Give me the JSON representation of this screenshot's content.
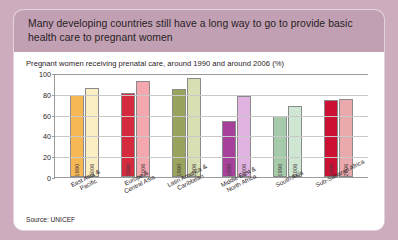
{
  "header": {
    "title": "Many developing countries still have a long way to go to provide basic health care to pregnant women"
  },
  "source": "Source: UNICEF",
  "chart_data": {
    "type": "bar",
    "title": "Pregnant women receiving prenatal care, around 1990 and around 2006 (%)",
    "xlabel": "",
    "ylabel": "",
    "ylim": [
      0,
      100
    ],
    "yticks": [
      100,
      80,
      60,
      40,
      20,
      0
    ],
    "grid": true,
    "legend": "in-bar",
    "categories": [
      "East Asia &\nPacific",
      "Europe &\nCentral Asia",
      "Latin America &\nCaribbean",
      "Middle East &\nNorth Africa",
      "South Asia",
      "Sub-Saharan Africa"
    ],
    "series": [
      {
        "name": "1990",
        "values": [
          79,
          81,
          85,
          54,
          59,
          74
        ],
        "colors": [
          "#f5b855",
          "#d52b3f",
          "#9aa35e",
          "#a6409a",
          "#a5cbab",
          "#cc1033"
        ]
      },
      {
        "name": "2006",
        "values": [
          86,
          92,
          95,
          78,
          68,
          75
        ],
        "colors": [
          "#fbeec2",
          "#f3a7ae",
          "#d8e0b3",
          "#e0b3e0",
          "#cfe6d2",
          "#eaa9ac"
        ]
      }
    ]
  }
}
